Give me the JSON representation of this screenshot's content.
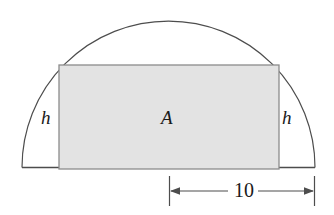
{
  "figure": {
    "type": "geometry-diagram",
    "colors": {
      "stroke": "#4d4d4d",
      "rectangle_fill": "#e3e3e3",
      "rectangle_stroke": "#808080",
      "text": "#1a1a1a",
      "background": "#ffffff"
    },
    "labels": {
      "height_left": "h",
      "height_right": "h",
      "area": "A",
      "width_dimension": "10"
    },
    "geometry": {
      "semicircle": {
        "center_x": 168.5,
        "baseline_y": 167.5,
        "radius": 146.5,
        "apex_y": 21
      },
      "rectangle": {
        "left": 59,
        "right": 279,
        "top": 65,
        "bottom": 169,
        "width": 220,
        "height": 104
      },
      "dimension_line": {
        "y": 191,
        "x_start": 169,
        "x_end": 315,
        "tick_top": 176,
        "tick_bottom": 206
      }
    }
  }
}
